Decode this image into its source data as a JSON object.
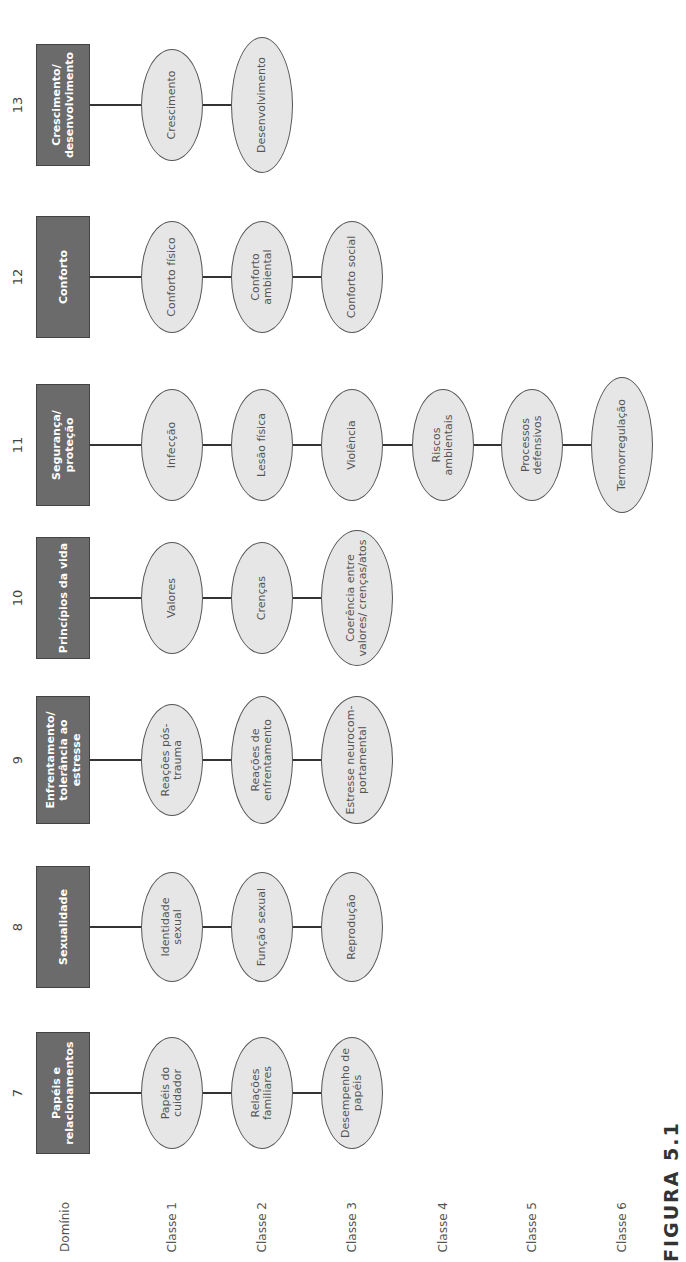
{
  "row_labels": [
    "Domínio",
    "Classe 1",
    "Classe 2",
    "Classe 3",
    "Classe 4",
    "Classe 5",
    "Classe 6"
  ],
  "caption": "FIGURA 5.1",
  "colors": {
    "domain_fill": "#6b6b6b",
    "class_fill": "#e6e6e6",
    "connector": "#333333"
  },
  "domains": [
    {
      "number": "7",
      "title": "Papéis e relacionamentos",
      "classes": [
        "Papéis do cuidador",
        "Relações familiares",
        "Desempenho de papéis"
      ]
    },
    {
      "number": "8",
      "title": "Sexualidade",
      "classes": [
        "Identidade sexual",
        "Função sexual",
        "Reprodução"
      ]
    },
    {
      "number": "9",
      "title": "Enfrentamento/ tolerância ao estresse",
      "classes": [
        "Reações pós-trauma",
        "Reações de enfrentamento",
        "Estresse neurocom-portamental"
      ]
    },
    {
      "number": "10",
      "title": "Princípios da vida",
      "classes": [
        "Valores",
        "Crenças",
        "Coerência entre valores/ crenças/atos"
      ]
    },
    {
      "number": "11",
      "title": "Segurança/ proteção",
      "classes": [
        "Infecção",
        "Lesão física",
        "Violência",
        "Riscos ambientais",
        "Processos defensivos",
        "Termorregulação"
      ]
    },
    {
      "number": "12",
      "title": "Conforto",
      "classes": [
        "Conforto físico",
        "Conforto ambiental",
        "Conforto social"
      ]
    },
    {
      "number": "13",
      "title": "Crescimento/ desenvolvimento",
      "classes": [
        "Crescimento",
        "Desenvolvimento"
      ]
    }
  ]
}
